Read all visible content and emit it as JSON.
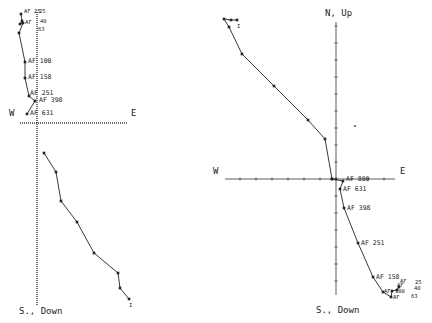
{
  "chart_data": [
    {
      "type": "line",
      "title": "",
      "id": "left-plot",
      "axes": {
        "vertical": {
          "x": 37,
          "y1": 12,
          "y2": 305,
          "style": "dotted",
          "top_label": "",
          "bottom_label": "S., Down"
        },
        "horizontal": {
          "y": 123,
          "x1": 20,
          "x2": 128,
          "style": "dotted",
          "left_label": "W",
          "right_label": "E"
        }
      },
      "labels": {
        "w": {
          "text": "W",
          "x": 9,
          "y": 116
        },
        "e": {
          "text": "E",
          "x": 131,
          "y": 116
        },
        "bottom": {
          "text": "S., Down",
          "x": 19,
          "y": 314
        }
      },
      "series": [
        {
          "name": "horizontal-projection",
          "points": [
            [
              21,
              14
            ],
            [
              22,
              21
            ],
            [
              20,
              24
            ],
            [
              23,
              23
            ],
            [
              19,
              33
            ],
            [
              25,
              62
            ],
            [
              25,
              78
            ],
            [
              29,
              96
            ],
            [
              35,
              101
            ],
            [
              27,
              114
            ]
          ],
          "step_labels": [
            {
              "text": "AF 25",
              "x": 24,
              "y": 13,
              "size": "small"
            },
            {
              "text": "25",
              "x": 39,
              "y": 13,
              "size": "small"
            },
            {
              "text": "AF",
              "x": 25,
              "y": 24,
              "size": "small"
            },
            {
              "text": "40",
              "x": 40,
              "y": 23,
              "size": "small"
            },
            {
              "text": "63",
              "x": 38,
              "y": 31,
              "size": "small"
            },
            {
              "text": "AF 100",
              "x": 28,
              "y": 63
            },
            {
              "text": "AF 158",
              "x": 28,
              "y": 79
            },
            {
              "text": "AF 251",
              "x": 30,
              "y": 95
            },
            {
              "text": "AF 398",
              "x": 39,
              "y": 102
            },
            {
              "text": "AF 631",
              "x": 30,
              "y": 115
            }
          ]
        },
        {
          "name": "vertical-projection",
          "points": [
            [
              44,
              153
            ],
            [
              56,
              172
            ],
            [
              61,
              201
            ],
            [
              77,
              222
            ],
            [
              94,
              253
            ],
            [
              118,
              273
            ],
            [
              120,
              288
            ],
            [
              129,
              299
            ]
          ],
          "end_label": {
            "text": "I",
            "x": 129,
            "y": 307
          }
        }
      ]
    },
    {
      "type": "line",
      "title": "",
      "id": "right-plot",
      "axes": {
        "vertical": {
          "x": 336,
          "y1": 22,
          "y2": 295,
          "style": "solid-ticked",
          "top_label": "N, Up",
          "bottom_label": "S., Down",
          "tick_spacing": 17
        },
        "horizontal": {
          "y": 179,
          "x1": 225,
          "x2": 395,
          "style": "solid-ticked",
          "left_label": "W",
          "right_label": "E",
          "tick_spacing": 16
        }
      },
      "labels": {
        "n": {
          "text": "N, Up",
          "x": 325,
          "y": 16
        },
        "w": {
          "text": "W",
          "x": 213,
          "y": 174
        },
        "e": {
          "text": "E",
          "x": 400,
          "y": 174
        },
        "bottom": {
          "text": "S., Down",
          "x": 316,
          "y": 313
        }
      },
      "series": [
        {
          "name": "vertical-projection",
          "points": [
            [
              237,
              20
            ],
            [
              231,
              20
            ],
            [
              224,
              19
            ],
            [
              229,
              27
            ],
            [
              242,
              54
            ],
            [
              274,
              86
            ],
            [
              308,
              120
            ],
            [
              325,
              139
            ],
            [
              332,
              179
            ]
          ],
          "end_label": {
            "text": "I",
            "x": 237,
            "y": 28
          }
        },
        {
          "name": "horizontal-projection",
          "points": [
            [
              332,
              179
            ],
            [
              343,
              181
            ],
            [
              340,
              189
            ],
            [
              344,
              208
            ],
            [
              358,
              243
            ],
            [
              373,
              277
            ],
            [
              383,
              292
            ],
            [
              391,
              297
            ],
            [
              392,
              291
            ],
            [
              397,
              290
            ],
            [
              399,
              287
            ]
          ],
          "step_labels": [
            {
              "text": "AF 800",
              "x": 346,
              "y": 181
            },
            {
              "text": "AF 631",
              "x": 343,
              "y": 191
            },
            {
              "text": "AF 398",
              "x": 347,
              "y": 210
            },
            {
              "text": "AF 251",
              "x": 361,
              "y": 245
            },
            {
              "text": "AF 158",
              "x": 376,
              "y": 279
            },
            {
              "text": "AF",
              "x": 384,
              "y": 293,
              "size": "small"
            },
            {
              "text": "100",
              "x": 395,
              "y": 293,
              "size": "small"
            },
            {
              "text": "AF",
              "x": 393,
              "y": 299,
              "size": "small"
            },
            {
              "text": "63",
              "x": 411,
              "y": 298,
              "size": "small"
            },
            {
              "text": "AF",
              "x": 397,
              "y": 287,
              "size": "small"
            },
            {
              "text": "40",
              "x": 414,
              "y": 290,
              "size": "small"
            },
            {
              "text": "AF",
              "x": 400,
              "y": 283,
              "size": "small"
            },
            {
              "text": "25",
              "x": 415,
              "y": 284,
              "size": "small"
            }
          ]
        }
      ],
      "stray_marks": [
        [
          355,
          126
        ]
      ]
    }
  ],
  "colors": {
    "ink": "#222222",
    "background": "#ffffff"
  }
}
